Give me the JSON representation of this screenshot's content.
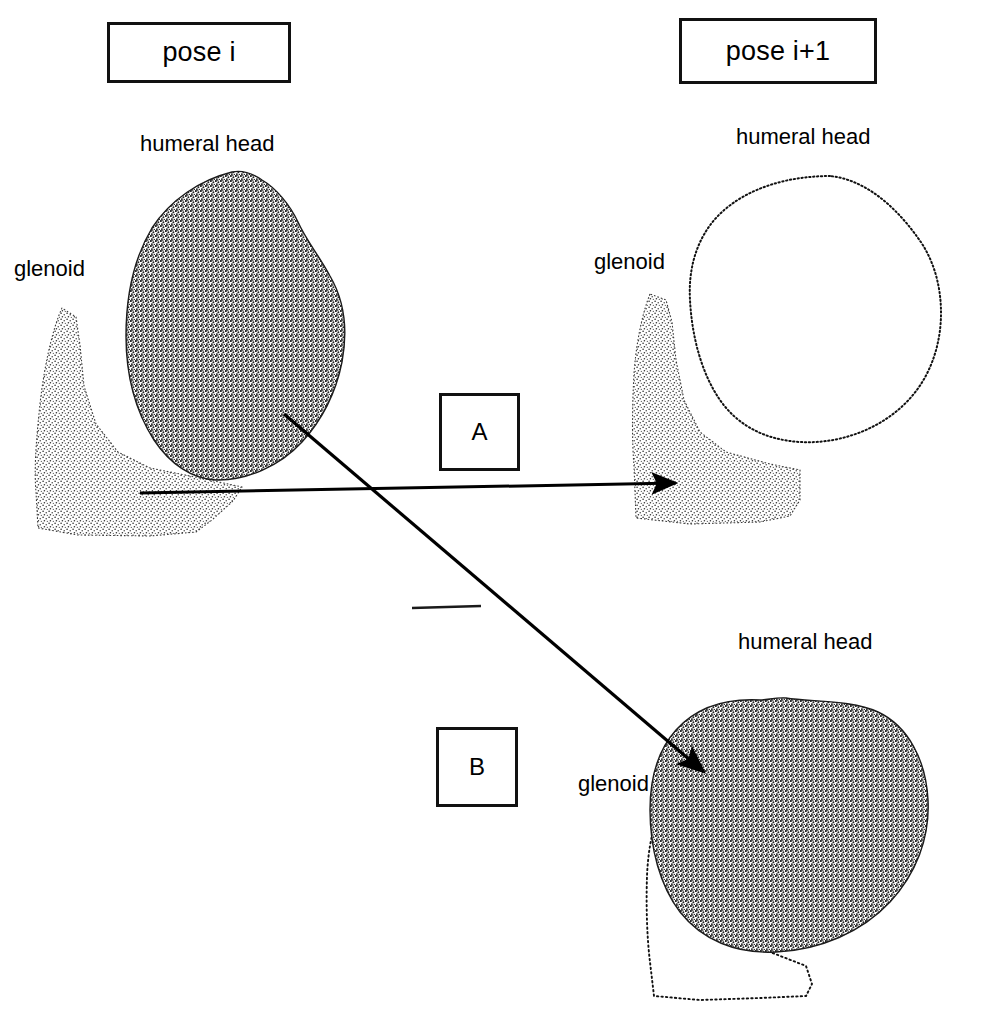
{
  "figure": {
    "title_boxes": [
      {
        "id": "pose-i",
        "label": "pose i"
      },
      {
        "id": "pose-i1",
        "label": "pose i+1"
      }
    ],
    "panel_labels": [
      {
        "id": "A",
        "label": "A"
      },
      {
        "id": "B",
        "label": "B"
      }
    ],
    "annotations": [
      {
        "id": "hh-top-left",
        "label": "humeral head",
        "region": "pose i"
      },
      {
        "id": "gl-top-left",
        "label": "glenoid",
        "region": "pose i"
      },
      {
        "id": "hh-top-right",
        "label": "humeral head",
        "region": "pose i+1 A"
      },
      {
        "id": "gl-top-right",
        "label": "glenoid",
        "region": "pose i+1 A"
      },
      {
        "id": "hh-bottom-right",
        "label": "humeral head",
        "region": "pose i+1 B"
      },
      {
        "id": "gl-bottom-right",
        "label": "glenoid",
        "region": "pose i+1 B"
      }
    ],
    "colors": {
      "ink": "#000000",
      "stipple_dark": "#2b2b2b",
      "stipple_light": "#555555",
      "background": "#ffffff",
      "box_border": "#111111"
    },
    "shapes": [
      {
        "id": "glenoid-pose-i",
        "fill": "stipple-light",
        "outline": false
      },
      {
        "id": "humeral-head-pose-i",
        "fill": "stipple-dark",
        "outline": false
      },
      {
        "id": "glenoid-pose-i1-a",
        "fill": "stipple-light",
        "outline": false
      },
      {
        "id": "humeral-head-pose-i1-a",
        "fill": "none",
        "outline": true
      },
      {
        "id": "glenoid-pose-i1-b",
        "fill": "none",
        "outline": true
      },
      {
        "id": "humeral-head-pose-i1-b",
        "fill": "stipple-dark",
        "outline": false
      }
    ],
    "arrows": [
      {
        "id": "arrow-a",
        "from": "humeral-head-pose-i / glenoid-pose-i",
        "to": "glenoid-pose-i1-a",
        "style": "straight-horizontal"
      },
      {
        "id": "arrow-b",
        "from": "humeral-head-pose-i",
        "to": "humeral-head-pose-i1-b",
        "style": "straight-diagonal"
      }
    ],
    "tick_mark": {
      "id": "divider-tick",
      "label": ""
    }
  }
}
